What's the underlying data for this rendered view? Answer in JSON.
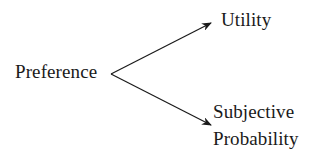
{
  "diagram": {
    "type": "branching-arrow-diagram",
    "source": {
      "label": "Preference"
    },
    "targets": [
      {
        "label": "Utility"
      },
      {
        "label_line1": "Subjective",
        "label_line2": "Probability"
      }
    ],
    "edges": [
      {
        "from": "Preference",
        "to": "Utility",
        "style": "arrow"
      },
      {
        "from": "Preference",
        "to": "Subjective Probability",
        "style": "arrow"
      }
    ],
    "colors": {
      "background": "#ffffff",
      "text": "#1a1a1a",
      "line": "#1a1a1a"
    }
  }
}
